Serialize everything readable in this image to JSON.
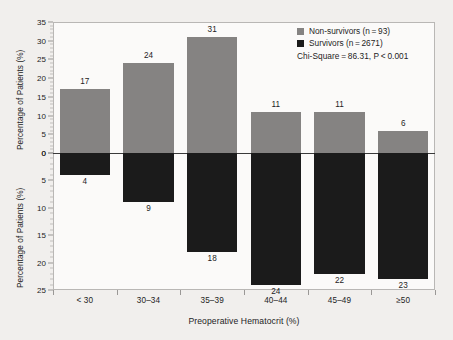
{
  "chart_data": {
    "type": "bar",
    "subtype": "diverging-stacked-bidirectional",
    "title": "",
    "xlabel": "Preoperative Hematocrit (%)",
    "ylabel_top": "Percentage of Patients (%)",
    "ylabel_bottom": "Percentage of Patients (%)",
    "categories": [
      "< 30",
      "30–34",
      "35–39",
      "40–44",
      "45–49",
      "≥50"
    ],
    "series": [
      {
        "name": "Non-survivors (n = 93)",
        "direction": "up",
        "color": "#858382",
        "values": [
          17,
          24,
          31,
          11,
          11,
          6
        ]
      },
      {
        "name": "Survivors (n = 2671)",
        "direction": "down",
        "color": "#1b1b1b",
        "values": [
          4,
          9,
          18,
          24,
          22,
          23
        ]
      }
    ],
    "ylim_top": [
      0,
      35
    ],
    "ylim_bottom": [
      0,
      25
    ],
    "yticks_top": [
      "35",
      "30",
      "25",
      "20",
      "15",
      "10",
      "5",
      "0"
    ],
    "yticks_bottom": [
      "0",
      "5",
      "10",
      "15",
      "20",
      "25"
    ],
    "grid": false,
    "legend_position": "top-right",
    "annotations": [
      "Chi-Square = 86.31,  P < 0.001"
    ]
  },
  "legend": {
    "entries": [
      {
        "label": "Non-survivors (n = 93)",
        "color": "#858382"
      },
      {
        "label": "Survivors (n = 2671)",
        "color": "#1b1b1b"
      }
    ],
    "stat_text": "Chi-Square = 86.31,  P < 0.001"
  },
  "axes": {
    "x_title": "Preoperative Hematocrit (%)",
    "y_title_top": "Percentage of Patients (%)",
    "y_title_bottom": "Percentage of Patients (%)"
  }
}
